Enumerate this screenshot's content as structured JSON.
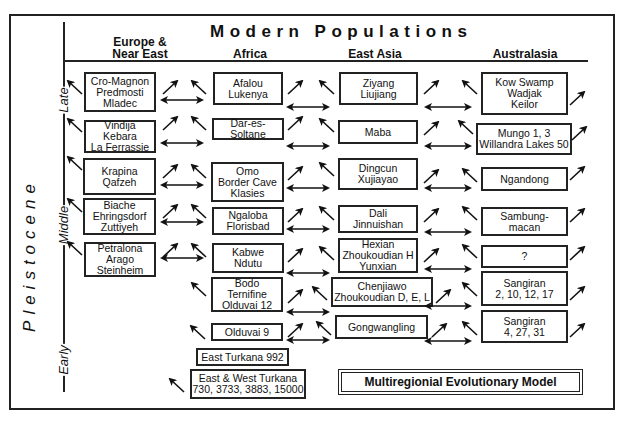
{
  "title": "Modern Populations",
  "epoch_label": "Pleistocene",
  "periods": [
    {
      "label": "Late",
      "y": 100
    },
    {
      "label": "Middle",
      "y": 225
    },
    {
      "label": "Early",
      "y": 360
    }
  ],
  "columns": [
    {
      "label_line1": "Europe &",
      "label_line2": "Near East"
    },
    {
      "label_line1": "",
      "label_line2": "Africa"
    },
    {
      "label_line1": "",
      "label_line2": "East Asia"
    },
    {
      "label_line1": "",
      "label_line2": "Australasia"
    }
  ],
  "boxes": {
    "europe": [
      {
        "text": "Cro-Magnon\nPredmosti\nMladec",
        "x": 84,
        "y": 72,
        "w": 72,
        "h": 40
      },
      {
        "text": "Vindija\nKebara\nLa Ferrassie",
        "x": 84,
        "y": 120,
        "w": 72,
        "h": 33
      },
      {
        "text": "Krapina\nQafzeh",
        "x": 83,
        "y": 158,
        "w": 73,
        "h": 37
      },
      {
        "text": "Biache\nEhringsdorf\nZuttiyeh",
        "x": 83,
        "y": 198,
        "w": 73,
        "h": 37
      },
      {
        "text": "Petralona\nArago\nSteinheim",
        "x": 84,
        "y": 242,
        "w": 72,
        "h": 35
      }
    ],
    "africa": [
      {
        "text": "Afalou\nLukenya",
        "x": 213,
        "y": 72,
        "w": 70,
        "h": 33
      },
      {
        "text": "Dar-es-Soltane",
        "x": 212,
        "y": 118,
        "w": 72,
        "h": 22
      },
      {
        "text": "Omo\nBorder Cave\nKlasies",
        "x": 211,
        "y": 162,
        "w": 73,
        "h": 40
      },
      {
        "text": "Ngaloba\nFlorisbad",
        "x": 212,
        "y": 207,
        "w": 72,
        "h": 28
      },
      {
        "text": "Kabwe\nNdutu",
        "x": 212,
        "y": 243,
        "w": 72,
        "h": 30
      },
      {
        "text": "Bodo\nTernifine\nOlduvai 12",
        "x": 211,
        "y": 277,
        "w": 72,
        "h": 35
      },
      {
        "text": "Olduvai 9",
        "x": 211,
        "y": 323,
        "w": 72,
        "h": 18
      },
      {
        "text": "East Turkana 992",
        "x": 196,
        "y": 348,
        "w": 93,
        "h": 18
      },
      {
        "text": "East & West Turkana\n730, 3733, 3883, 15000",
        "x": 190,
        "y": 369,
        "w": 116,
        "h": 30
      }
    ],
    "east_asia": [
      {
        "text": "Ziyang\nLiujiang",
        "x": 339,
        "y": 72,
        "w": 79,
        "h": 33
      },
      {
        "text": "Maba",
        "x": 338,
        "y": 120,
        "w": 80,
        "h": 24
      },
      {
        "text": "Dingcun\nXujiayao",
        "x": 338,
        "y": 158,
        "w": 80,
        "h": 32
      },
      {
        "text": "Dali\nJinnuishan",
        "x": 338,
        "y": 205,
        "w": 80,
        "h": 28
      },
      {
        "text": "Hexian\nZhoukoudian H\nYunxian",
        "x": 338,
        "y": 238,
        "w": 80,
        "h": 35
      },
      {
        "text": "Chenjiawo\nZhoukoudian D, E, L",
        "x": 331,
        "y": 277,
        "w": 102,
        "h": 30
      },
      {
        "text": "Gongwangling",
        "x": 335,
        "y": 315,
        "w": 93,
        "h": 24
      }
    ],
    "australasia": [
      {
        "text": "Kow Swamp\nWadjak\nKeilor",
        "x": 481,
        "y": 72,
        "w": 87,
        "h": 43
      },
      {
        "text": "Mungo 1, 3\nWillandra Lakes 50",
        "x": 476,
        "y": 123,
        "w": 96,
        "h": 32
      },
      {
        "text": "Ngandong",
        "x": 481,
        "y": 167,
        "w": 87,
        "h": 24
      },
      {
        "text": "Sambung-\nmacan",
        "x": 481,
        "y": 207,
        "w": 87,
        "h": 29
      },
      {
        "text": "?",
        "x": 481,
        "y": 245,
        "w": 87,
        "h": 23
      },
      {
        "text": "Sangiran\n2, 10, 12, 17",
        "x": 481,
        "y": 271,
        "w": 87,
        "h": 35
      },
      {
        "text": "Sangiran\n4, 27, 31",
        "x": 481,
        "y": 310,
        "w": 87,
        "h": 33
      }
    ]
  },
  "model_label": "Multiregionial Evolutionary Model",
  "icons": {
    "diagonal_arrow": "arrow-up-right-icon",
    "diagonal_arrow_left": "arrow-up-left-icon",
    "double_arrow": "double-headed-arrow-icon"
  }
}
